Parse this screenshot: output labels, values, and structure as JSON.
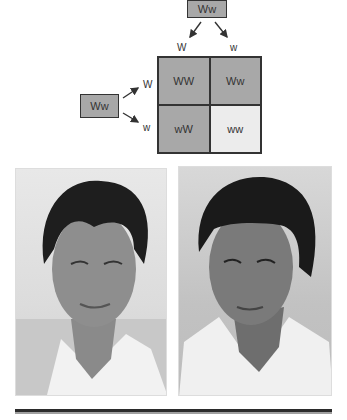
{
  "diagram": {
    "parent_top": {
      "label": "Ww"
    },
    "parent_left": {
      "label": "Ww"
    },
    "top_alleles": [
      "W",
      "w"
    ],
    "left_alleles": [
      "W",
      "w"
    ],
    "punnett": [
      {
        "label": "WW",
        "color": "#a8a8a8"
      },
      {
        "label": "Ww",
        "color": "#a8a8a8"
      },
      {
        "label": "wW",
        "color": "#a8a8a8"
      },
      {
        "label": "ww",
        "color": "#ececec"
      }
    ]
  },
  "photos": [
    {
      "description": "Man with widow's peak hairline, smiling"
    },
    {
      "description": "Man with straight hairline, looking to the side"
    }
  ]
}
